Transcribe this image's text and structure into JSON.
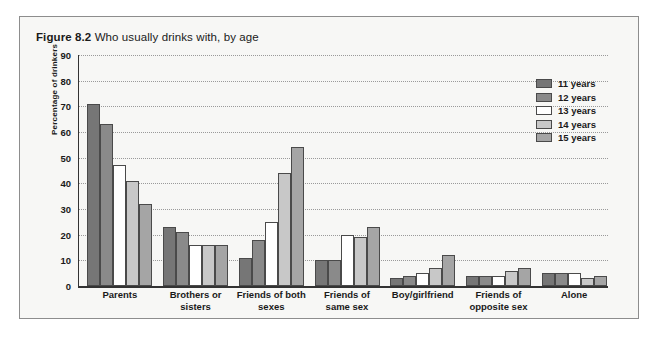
{
  "figure": {
    "number": "Figure 8.2",
    "title": "Who usually drinks with, by age"
  },
  "chart_data": {
    "type": "bar",
    "title": "Who usually drinks with, by age",
    "xlabel": "",
    "ylabel": "Percentage of drinkers",
    "ylim": [
      0,
      90
    ],
    "ytick_step": 10,
    "yticks": [
      "90",
      "80",
      "70",
      "60",
      "50",
      "40",
      "30",
      "20",
      "10",
      "0"
    ],
    "grid": true,
    "legend_position": "top-right",
    "categories": [
      "Parents",
      "Brothers or sisters",
      "Friends of both sexes",
      "Friends of same sex",
      "Boy/girlfriend",
      "Friends of opposite sex",
      "Alone"
    ],
    "category_lines": [
      [
        "Parents"
      ],
      [
        "Brothers or",
        "sisters"
      ],
      [
        "Friends of both",
        "sexes"
      ],
      [
        "Friends of",
        "same sex"
      ],
      [
        "Boy/girlfriend"
      ],
      [
        "Friends of",
        "opposite sex"
      ],
      [
        "Alone"
      ]
    ],
    "series": [
      {
        "name": "11 years",
        "color": "#767676",
        "values": [
          71,
          23,
          11,
          10,
          3,
          4,
          5
        ]
      },
      {
        "name": "12 years",
        "color": "#8a8a8a",
        "values": [
          63,
          21,
          18,
          10,
          4,
          4,
          5
        ]
      },
      {
        "name": "13 years",
        "color": "#ffffff",
        "values": [
          47,
          16,
          25,
          20,
          5,
          4,
          5
        ]
      },
      {
        "name": "14 years",
        "color": "#c8c8c8",
        "values": [
          41,
          16,
          44,
          19,
          7,
          6,
          3
        ]
      },
      {
        "name": "15 years",
        "color": "#a5a5a5",
        "values": [
          32,
          16,
          54,
          23,
          12,
          7,
          4
        ]
      }
    ]
  }
}
